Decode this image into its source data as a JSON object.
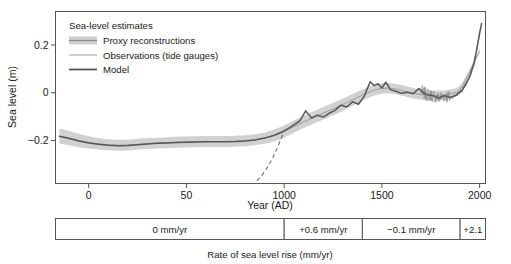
{
  "figure": {
    "y_axis": {
      "title": "Sea level (m)",
      "ticks": [
        "0.2",
        "0",
        "-0.2"
      ],
      "tick_values": [
        0.2,
        0.0,
        -0.2
      ],
      "min": -0.38,
      "max": 0.34
    },
    "x_axis": {
      "title": "Year (AD)",
      "ticks": [
        "0",
        "50",
        "1000",
        "1500",
        "2000"
      ],
      "tick_values": [
        0,
        500,
        1000,
        1500,
        2000
      ],
      "min": -170,
      "max": 2030
    },
    "legend": {
      "title": "Sea-level estimates",
      "items": [
        {
          "label": "Proxy reconstructions",
          "marker": "band-swatch",
          "color": "#555555",
          "band_color": "#c9c9c9"
        },
        {
          "label": "Observations (tide gauges)",
          "marker": "thin-line",
          "color": "#9a9a9a"
        },
        {
          "label": "Model",
          "marker": "thick-line",
          "color": "#555555"
        }
      ]
    },
    "rate_table": {
      "caption": "Rate of sea level rise (mm/yr)",
      "cells": [
        {
          "label": "0 mm/yr",
          "value": 0.0,
          "start_year": -170,
          "end_year": 1000
        },
        {
          "label": "+0.6 mm/yr",
          "value": 0.6,
          "start_year": 1000,
          "end_year": 1400
        },
        {
          "label": "-0.1 mm/yr",
          "value": -0.1,
          "start_year": 1400,
          "end_year": 1900
        },
        {
          "label": "+2.1",
          "value": 2.1,
          "start_year": 1900,
          "end_year": 2030
        }
      ]
    }
  },
  "chart_data": {
    "type": "line",
    "title": "",
    "xlabel": "Year (AD)",
    "ylabel": "Sea level (m)",
    "xlim": [
      -170,
      2030
    ],
    "ylim": [
      -0.38,
      0.34
    ],
    "grid": false,
    "legend_position": "top-left",
    "x_ticks": [
      0,
      500,
      1000,
      1500,
      2000
    ],
    "x_tick_labels": [
      "0",
      "50",
      "1000",
      "1500",
      "2000"
    ],
    "y_ticks": [
      0.2,
      0,
      -0.2
    ],
    "y_tick_labels": [
      "0.2",
      "0",
      "-0.2"
    ],
    "series": [
      {
        "name": "Proxy reconstructions",
        "type": "band",
        "color": "#c9c9c9",
        "x": [
          -150,
          -100,
          -50,
          0,
          50,
          100,
          150,
          200,
          250,
          300,
          350,
          400,
          450,
          500,
          550,
          600,
          650,
          700,
          750,
          800,
          850,
          900,
          950,
          1000,
          1050,
          1100,
          1150,
          1200,
          1250,
          1300,
          1350,
          1400,
          1450,
          1500,
          1550,
          1600,
          1650,
          1700,
          1750,
          1800,
          1850,
          1900,
          1950,
          2000
        ],
        "center": [
          -0.182,
          -0.19,
          -0.2,
          -0.208,
          -0.214,
          -0.218,
          -0.22,
          -0.219,
          -0.216,
          -0.213,
          -0.211,
          -0.209,
          -0.207,
          -0.206,
          -0.205,
          -0.204,
          -0.204,
          -0.204,
          -0.203,
          -0.201,
          -0.197,
          -0.19,
          -0.178,
          -0.162,
          -0.142,
          -0.122,
          -0.104,
          -0.086,
          -0.068,
          -0.05,
          -0.03,
          -0.01,
          0.008,
          0.018,
          0.018,
          0.01,
          0.0,
          -0.008,
          -0.012,
          -0.012,
          -0.005,
          0.015,
          0.09,
          0.175
        ],
        "upper": [
          -0.15,
          -0.16,
          -0.172,
          -0.182,
          -0.19,
          -0.195,
          -0.197,
          -0.196,
          -0.193,
          -0.19,
          -0.188,
          -0.186,
          -0.184,
          -0.183,
          -0.182,
          -0.181,
          -0.181,
          -0.181,
          -0.18,
          -0.178,
          -0.174,
          -0.166,
          -0.153,
          -0.136,
          -0.116,
          -0.096,
          -0.078,
          -0.06,
          -0.042,
          -0.024,
          -0.005,
          0.014,
          0.031,
          0.04,
          0.04,
          0.032,
          0.022,
          0.013,
          0.009,
          0.009,
          0.014,
          0.03,
          0.1,
          0.182
        ],
        "lower": [
          -0.214,
          -0.22,
          -0.228,
          -0.234,
          -0.238,
          -0.241,
          -0.243,
          -0.242,
          -0.239,
          -0.236,
          -0.234,
          -0.232,
          -0.23,
          -0.229,
          -0.228,
          -0.227,
          -0.227,
          -0.227,
          -0.226,
          -0.224,
          -0.22,
          -0.214,
          -0.203,
          -0.188,
          -0.168,
          -0.148,
          -0.13,
          -0.112,
          -0.094,
          -0.076,
          -0.055,
          -0.034,
          -0.015,
          -0.004,
          -0.004,
          -0.012,
          -0.022,
          -0.029,
          -0.033,
          -0.033,
          -0.024,
          -0.002,
          0.078,
          0.168
        ]
      },
      {
        "name": "Model",
        "type": "line",
        "color": "#5a5a5a",
        "x": [
          -150,
          -100,
          -50,
          0,
          50,
          100,
          150,
          200,
          250,
          300,
          350,
          400,
          450,
          500,
          550,
          600,
          650,
          700,
          750,
          800,
          850,
          900,
          950,
          1000,
          1040,
          1080,
          1110,
          1140,
          1170,
          1200,
          1230,
          1260,
          1290,
          1320,
          1350,
          1380,
          1410,
          1440,
          1460,
          1480,
          1500,
          1520,
          1545,
          1570,
          1600,
          1630,
          1660,
          1690,
          1710,
          1730,
          1760,
          1790,
          1820,
          1850,
          1880,
          1910,
          1930,
          1950,
          1970,
          1985,
          2000,
          2010
        ],
        "y": [
          -0.182,
          -0.192,
          -0.202,
          -0.21,
          -0.216,
          -0.22,
          -0.222,
          -0.221,
          -0.218,
          -0.215,
          -0.212,
          -0.21,
          -0.208,
          -0.207,
          -0.206,
          -0.205,
          -0.205,
          -0.205,
          -0.204,
          -0.202,
          -0.198,
          -0.19,
          -0.178,
          -0.16,
          -0.14,
          -0.118,
          -0.076,
          -0.106,
          -0.094,
          -0.102,
          -0.086,
          -0.074,
          -0.052,
          -0.06,
          -0.038,
          -0.048,
          -0.014,
          0.046,
          0.03,
          0.038,
          0.02,
          0.044,
          0.012,
          0.006,
          -0.002,
          0.002,
          -0.004,
          0.018,
          0.0,
          -0.008,
          -0.012,
          -0.022,
          -0.012,
          -0.02,
          -0.01,
          0.01,
          0.036,
          0.068,
          0.12,
          0.18,
          0.25,
          0.29
        ]
      },
      {
        "name": "Observations (tide gauges)",
        "type": "line",
        "color": "#8e8e8e",
        "x_range": [
          1700,
          2000
        ],
        "note": "noisy tide-gauge record overlaying the model from ~1700 to 2000"
      },
      {
        "name": "Model (pre-1000 dashed extension)",
        "type": "dashed-line",
        "color": "#6e6e6e",
        "x": [
          860,
          880,
          900,
          920,
          940,
          960,
          980,
          1000
        ],
        "y": [
          -0.368,
          -0.352,
          -0.33,
          -0.305,
          -0.275,
          -0.24,
          -0.2,
          -0.16
        ]
      }
    ]
  }
}
